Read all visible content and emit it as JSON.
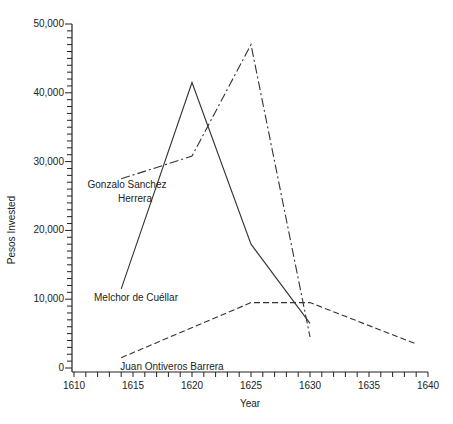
{
  "chart_data": {
    "type": "line",
    "title": "",
    "xlabel": "Year",
    "ylabel": "Pesos Invested",
    "xlim": [
      1610,
      1640
    ],
    "ylim": [
      0,
      50000
    ],
    "x_ticks": [
      1610,
      1615,
      1620,
      1625,
      1630,
      1635,
      1640
    ],
    "x_tick_labels": [
      "1610",
      "1615",
      "1620",
      "1625",
      "1630",
      "1635",
      "1640"
    ],
    "y_ticks": [
      0,
      10000,
      20000,
      30000,
      40000,
      50000
    ],
    "y_tick_labels": [
      "0",
      "10,000",
      "20,000",
      "30,000",
      "40,000",
      "50,000"
    ],
    "grid": false,
    "legend": "inline labels",
    "series": [
      {
        "name": "Melchor de Cuéllar",
        "style": "solid",
        "label_lines": [
          "Melchor de Cuéllar"
        ],
        "x": [
          1614,
          1620,
          1625,
          1630
        ],
        "values": [
          11500,
          41500,
          18000,
          6500
        ]
      },
      {
        "name": "Gonzalo Sanchez Herrera",
        "style": "dash-dot",
        "label_lines": [
          "Gonzalo Sanchez",
          "Herrera"
        ],
        "x": [
          1614,
          1620,
          1625,
          1630
        ],
        "values": [
          27500,
          30800,
          47000,
          4500
        ]
      },
      {
        "name": "Juan Ontiveros Barrera",
        "style": "dashed",
        "label_lines": [
          "Juan Ontiveros Barrera"
        ],
        "x": [
          1614,
          1625,
          1630,
          1639
        ],
        "values": [
          1500,
          9500,
          9500,
          3500
        ]
      }
    ]
  }
}
